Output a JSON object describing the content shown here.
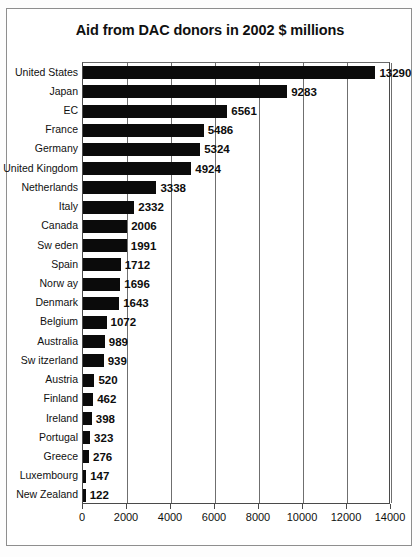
{
  "chart_data": {
    "type": "bar",
    "orientation": "horizontal",
    "title": "Aid from DAC donors in 2002 $ millions",
    "xlabel": "",
    "ylabel": "",
    "xlim": [
      0,
      14000
    ],
    "xticks": [
      0,
      2000,
      4000,
      6000,
      8000,
      10000,
      12000,
      14000
    ],
    "xtick_labels": [
      "0",
      "2000",
      "4000",
      "6000",
      "8000",
      "10000",
      "12000",
      "14000"
    ],
    "grid": true,
    "grid_axis": "x",
    "legend": false,
    "bar_color": "#0b0b0b",
    "categories": [
      "United States",
      "Japan",
      "EC",
      "France",
      "Germany",
      "United Kingdom",
      "Netherlands",
      "Italy",
      "Canada",
      "Sw eden",
      "Spain",
      "Norw ay",
      "Denmark",
      "Belgium",
      "Australia",
      "Sw itzerland",
      "Austria",
      "Finland",
      "Ireland",
      "Portugal",
      "Greece",
      "Luxembourg",
      "New  Zealand"
    ],
    "values": [
      13290,
      9283,
      6561,
      5486,
      5324,
      4924,
      3338,
      2332,
      2006,
      1991,
      1712,
      1696,
      1643,
      1072,
      989,
      939,
      520,
      462,
      398,
      323,
      276,
      147,
      122
    ],
    "value_labels": [
      "13290",
      "9283",
      "6561",
      "5486",
      "5324",
      "4924",
      "3338",
      "2332",
      "2006",
      "1991",
      "1712",
      "1696",
      "1643",
      "1072",
      "989",
      "939",
      "520",
      "462",
      "398",
      "323",
      "276",
      "147",
      "122"
    ]
  }
}
